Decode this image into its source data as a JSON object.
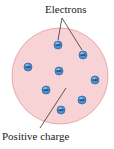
{
  "diagram": {
    "labels": {
      "electrons": "Electrons",
      "positive_charge": "Positive charge"
    },
    "colors": {
      "sphere_fill": "#f7d3d6",
      "sphere_stroke": "#e8a9ae",
      "electron_fill": "#4f8fd0",
      "electron_stroke": "#2f6aa8",
      "leader_line": "#333333"
    },
    "sphere": {
      "cx": 60,
      "cy": 76,
      "r": 48
    },
    "electrons": [
      {
        "x": 58,
        "y": 45,
        "sign": "-"
      },
      {
        "x": 83,
        "y": 55,
        "sign": "-"
      },
      {
        "x": 28,
        "y": 67,
        "sign": "-"
      },
      {
        "x": 59,
        "y": 71,
        "sign": "-"
      },
      {
        "x": 95,
        "y": 80,
        "sign": "-"
      },
      {
        "x": 46,
        "y": 90,
        "sign": "-"
      },
      {
        "x": 82,
        "y": 100,
        "sign": "-"
      },
      {
        "x": 61,
        "y": 110,
        "sign": "-"
      }
    ]
  }
}
